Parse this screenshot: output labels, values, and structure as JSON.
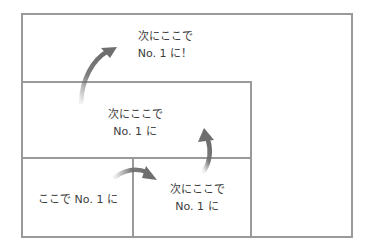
{
  "diagram": {
    "levels": [
      {
        "id": "top",
        "line1": "次にここで",
        "line2": "No. 1 に！"
      },
      {
        "id": "middle",
        "line1": "次にここで",
        "line2": "No. 1 に"
      },
      {
        "id": "bottom-right",
        "line1": "次にここで",
        "line2": "No. 1 に"
      },
      {
        "id": "bottom-left",
        "line1": "ここで No. 1 に"
      }
    ],
    "colors": {
      "border": "#9a9a9a",
      "arrow": "#6e6e6e",
      "text": "#3c3c3c"
    },
    "arrows": [
      {
        "from": "bottom-left",
        "to": "bottom-right"
      },
      {
        "from": "bottom-right",
        "to": "middle"
      },
      {
        "from": "middle",
        "to": "top"
      }
    ]
  }
}
